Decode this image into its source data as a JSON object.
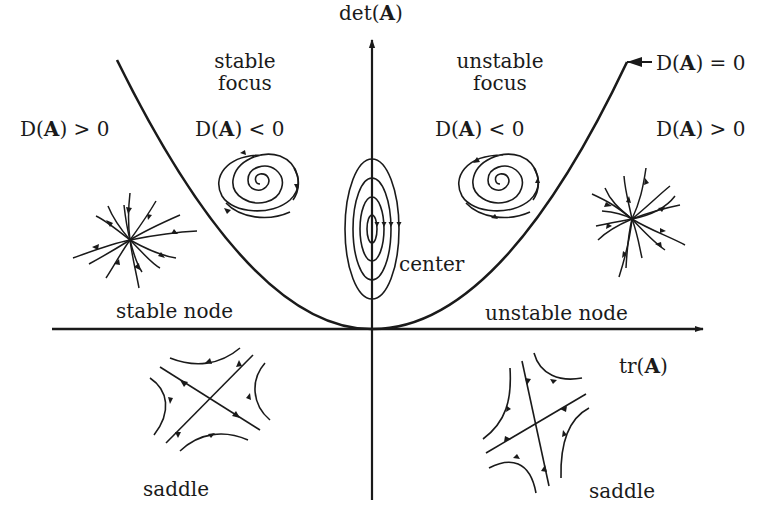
{
  "diagram": {
    "axes": {
      "vertical_label_prefix": "det(",
      "vertical_label_bold": "A",
      "vertical_label_suffix": ")",
      "horizontal_label_prefix": "tr(",
      "horizontal_label_bold": "A",
      "horizontal_label_suffix": ")"
    },
    "curve": {
      "label_prefix": "D(",
      "label_bold": "A",
      "label_suffix": ") = 0"
    },
    "regions": {
      "outer_left": {
        "prefix": "D(",
        "bold": "A",
        "suffix": ") > 0"
      },
      "inner_left": {
        "prefix": "D(",
        "bold": "A",
        "suffix": ") < 0"
      },
      "inner_right": {
        "prefix": "D(",
        "bold": "A",
        "suffix": ") < 0"
      },
      "outer_right": {
        "prefix": "D(",
        "bold": "A",
        "suffix": ") > 0"
      }
    },
    "labels": {
      "stable_focus_line1": "stable",
      "stable_focus_line2": "focus",
      "unstable_focus_line1": "unstable",
      "unstable_focus_line2": "focus",
      "center": "center",
      "stable_node": "stable node",
      "unstable_node": "unstable node",
      "saddle_left": "saddle",
      "saddle_right": "saddle"
    },
    "colors": {
      "ink": "#1a1a1a",
      "background": "#ffffff"
    }
  }
}
